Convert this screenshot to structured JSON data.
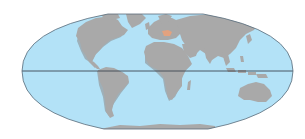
{
  "map": {
    "projection": "mollweide-style ellipse",
    "ocean_color": "#b3e2f7",
    "land_color": "#a9a9a9",
    "land_shadow_color": "#8d8d8d",
    "border_color": "#5a6b78",
    "equator_color": "#3d4650",
    "highlight_color": "#e3a27f",
    "highlighted_region": "Hungary",
    "features": [
      "equator-line",
      "continents",
      "highlighted-country",
      "antarctica"
    ]
  }
}
